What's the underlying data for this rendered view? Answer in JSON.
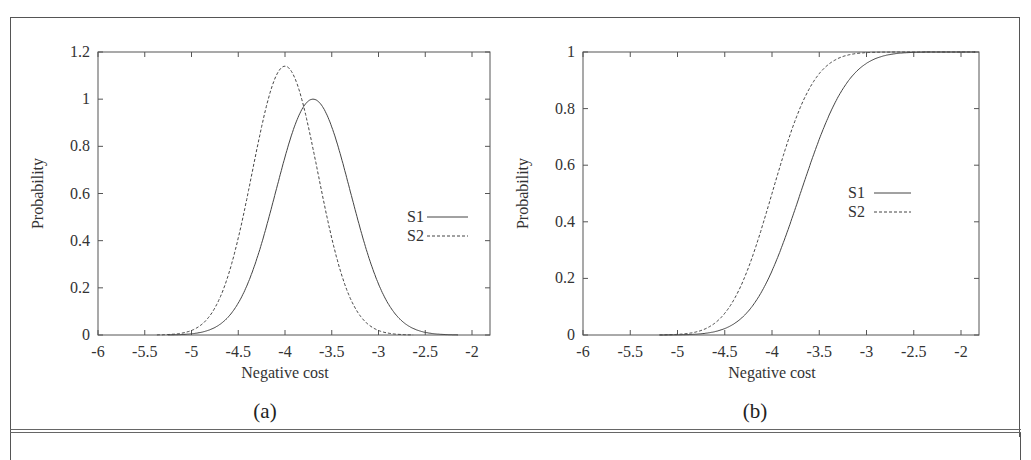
{
  "figure": {
    "captions": [
      "(a)",
      "(b)"
    ]
  },
  "chart_data": [
    {
      "id": "a",
      "type": "line",
      "caption": "(a)",
      "title": "",
      "xlabel": "Negative cost",
      "ylabel": "Probability",
      "xlim": [
        -6,
        -1.8
      ],
      "ylim": [
        0,
        1.2
      ],
      "xticks": [
        -6,
        -5.5,
        -5,
        -4.5,
        -4,
        -3.5,
        -3,
        -2.5,
        -2
      ],
      "xtick_labels": [
        "-6",
        "-5.5",
        "-5",
        "-4.5",
        "-4",
        "-3.5",
        "-3",
        "-2.5",
        "-2"
      ],
      "yticks": [
        0,
        0.2,
        0.4,
        0.6,
        0.8,
        1,
        1.2
      ],
      "ytick_labels": [
        "0",
        "0.2",
        "0.4",
        "0.6",
        "0.8",
        "1",
        "1.2"
      ],
      "grid": false,
      "legend_position": "right-middle",
      "series": [
        {
          "name": "S1",
          "style": "solid",
          "kind": "gaussian_pdf",
          "mean": -3.7,
          "sd": 0.4,
          "peak": 1.0,
          "x": [
            -5.5,
            -5.0,
            -4.5,
            -4.25,
            -4.0,
            -3.7,
            -3.5,
            -3.25,
            -3.0,
            -2.5,
            -2.0
          ],
          "values": [
            0.0,
            0.01,
            0.13,
            0.39,
            0.75,
            1.0,
            0.88,
            0.53,
            0.22,
            0.01,
            0.0
          ]
        },
        {
          "name": "S2",
          "style": "dashed",
          "kind": "gaussian_pdf",
          "mean": -4.0,
          "sd": 0.35,
          "peak": 1.14,
          "x": [
            -5.5,
            -5.0,
            -4.5,
            -4.25,
            -4.0,
            -3.75,
            -3.5,
            -3.25,
            -3.0,
            -2.5
          ],
          "values": [
            0.0,
            0.02,
            0.41,
            0.89,
            1.14,
            0.89,
            0.41,
            0.12,
            0.02,
            0.0
          ]
        }
      ]
    },
    {
      "id": "b",
      "type": "line",
      "caption": "(b)",
      "title": "",
      "xlabel": "Negative cost",
      "ylabel": "Probability",
      "xlim": [
        -6,
        -1.8
      ],
      "ylim": [
        0,
        1
      ],
      "xticks": [
        -6,
        -5.5,
        -5,
        -4.5,
        -4,
        -3.5,
        -3,
        -2.5,
        -2
      ],
      "xtick_labels": [
        "-6",
        "-5.5",
        "-5",
        "-4.5",
        "-4",
        "-3.5",
        "-3",
        "-2.5",
        "-2"
      ],
      "yticks": [
        0,
        0.2,
        0.4,
        0.6,
        0.8,
        1
      ],
      "ytick_labels": [
        "0",
        "0.2",
        "0.4",
        "0.6",
        "0.8",
        "1"
      ],
      "grid": false,
      "legend_position": "right-middle",
      "series": [
        {
          "name": "S1",
          "style": "solid",
          "kind": "gaussian_cdf",
          "mean": -3.7,
          "sd": 0.4,
          "x": [
            -5.0,
            -4.5,
            -4.0,
            -3.7,
            -3.5,
            -3.0,
            -2.5
          ],
          "values": [
            0.0,
            0.02,
            0.23,
            0.5,
            0.69,
            0.96,
            1.0
          ]
        },
        {
          "name": "S2",
          "style": "dashed",
          "kind": "gaussian_cdf",
          "mean": -4.0,
          "sd": 0.35,
          "x": [
            -5.0,
            -4.5,
            -4.0,
            -3.5,
            -3.0,
            -2.5
          ],
          "values": [
            0.0,
            0.08,
            0.5,
            0.92,
            1.0,
            1.0
          ]
        }
      ]
    }
  ]
}
